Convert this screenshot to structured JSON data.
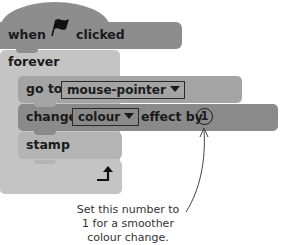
{
  "script": {
    "hat_block": {
      "prefix": "when",
      "icon": "green-flag-icon",
      "suffix": "clicked"
    },
    "forever_block": {
      "label": "forever",
      "loop_icon": "loop-arrow-icon"
    },
    "goto_block": {
      "label": "go to",
      "dropdown_value": "mouse-pointer"
    },
    "change_block": {
      "label": "change",
      "dropdown_value": "colour",
      "middle": "effect by",
      "value": "1"
    },
    "stamp_block": {
      "label": "stamp"
    }
  },
  "annotation": {
    "line1": "Set this number to",
    "line2": "1 for a smoother",
    "line3": "colour change."
  },
  "colors": {
    "hat": "#8c8c8c",
    "forever": "#c4c4c4",
    "goto": "#a3a3a3",
    "change": "#8a8a8a",
    "stamp": "#b3b3b3"
  }
}
